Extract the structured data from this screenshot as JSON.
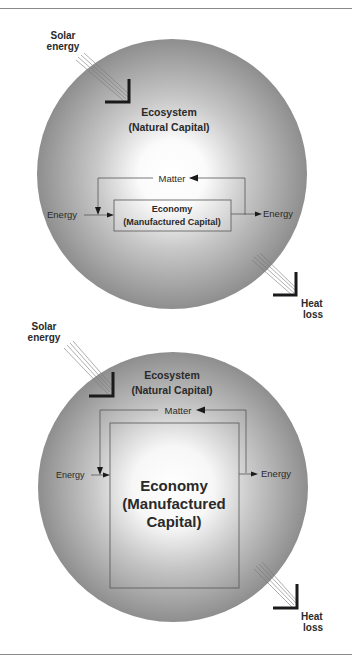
{
  "diagrams": [
    {
      "id": "small-economy",
      "solar_label": [
        "Solar",
        "energy"
      ],
      "ecosystem_label": [
        "Ecosystem",
        "(Natural Capital)"
      ],
      "matter_label": "Matter",
      "economy_label": [
        "Economy",
        "(Manufactured Capital)"
      ],
      "energy_in_label": "Energy",
      "energy_out_label": "Energy",
      "heat_label": [
        "Heat",
        "loss"
      ]
    },
    {
      "id": "large-economy",
      "solar_label": [
        "Solar",
        "energy"
      ],
      "ecosystem_label": [
        "Ecosystem",
        "(Natural Capital)"
      ],
      "matter_label": "Matter",
      "economy_label": [
        "Economy",
        "(Manufactured",
        "Capital)"
      ],
      "energy_in_label": "Energy",
      "energy_out_label": "Energy",
      "heat_label": [
        "Heat",
        "loss"
      ]
    }
  ],
  "colors": {
    "sphere_edge": "#8c8c8c",
    "sphere_center": "#ffffff",
    "line": "#555555",
    "arrow": "#1a1a1a"
  }
}
